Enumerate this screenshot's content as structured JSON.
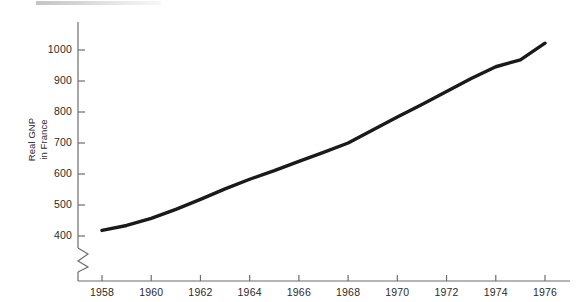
{
  "figure": {
    "background_color": "#ffffff",
    "line_color": "#1a1a1a",
    "axis_color": "#6d6d6d",
    "text_color": "#2b2b2b"
  },
  "axis_title": {
    "line1": "Real GNP",
    "line2": "in France"
  },
  "chart_data": {
    "type": "line",
    "title": "",
    "subtitle": "",
    "xlabel": "",
    "ylabel": "Real GNP in France",
    "xlim": [
      1957,
      1976.6
    ],
    "ylim": [
      370,
      1055
    ],
    "axis_break": true,
    "axis_break_note": "y-axis broken below 400",
    "grid": false,
    "legend": false,
    "legend_position": "none",
    "xticks": [
      1958,
      1960,
      1962,
      1964,
      1966,
      1968,
      1970,
      1972,
      1974,
      1976
    ],
    "xtick_labels": [
      "1958",
      "1960",
      "1962",
      "1964",
      "1966",
      "1968",
      "1970",
      "1972",
      "1974",
      "1976"
    ],
    "yticks": [
      400,
      500,
      600,
      700,
      800,
      900,
      1000
    ],
    "ytick_labels": [
      "400",
      "500",
      "600",
      "700",
      "800",
      "900",
      "1000"
    ],
    "series": [
      {
        "name": "Real GNP in France",
        "x": [
          1958,
          1959,
          1960,
          1961,
          1962,
          1963,
          1964,
          1965,
          1966,
          1967,
          1968,
          1969,
          1970,
          1971,
          1972,
          1973,
          1974,
          1975,
          1976
        ],
        "values": [
          418,
          434,
          457,
          486,
          518,
          552,
          583,
          611,
          641,
          670,
          700,
          742,
          784,
          824,
          866,
          908,
          946,
          968,
          1022
        ]
      }
    ]
  }
}
